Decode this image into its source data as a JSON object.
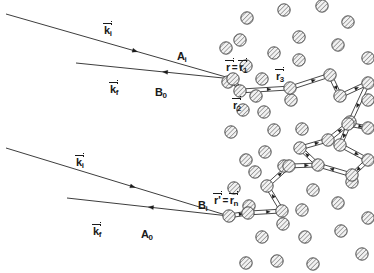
{
  "figure": {
    "background_color": "#ffffff",
    "line_color": "#1a1a1a",
    "scatterer_fill": "#e8e8e8",
    "scatterer_stroke": "#3a3a3a",
    "scatterer_radius": 6.2
  },
  "labels": [
    {
      "name": "k-incident-upper",
      "base": "k",
      "sub": "i",
      "vector": true,
      "x": 104,
      "y": 21
    },
    {
      "name": "k-final-upper",
      "base": "k",
      "sub": "f",
      "vector": true,
      "x": 110,
      "y": 80
    },
    {
      "name": "path-label-A-i",
      "base": "A",
      "sub": "i",
      "vector": false,
      "x": 177,
      "y": 47
    },
    {
      "name": "path-label-B-0",
      "base": "B",
      "sub": "0",
      "vector": false,
      "x": 155,
      "y": 83
    },
    {
      "name": "k-incident-lower",
      "base": "k",
      "sub": "i",
      "vector": true,
      "x": 76,
      "y": 153
    },
    {
      "name": "k-final-lower",
      "base": "k",
      "sub": "f",
      "vector": true,
      "x": 93,
      "y": 222
    },
    {
      "name": "path-label-B-i",
      "base": "B",
      "sub": "i",
      "vector": false,
      "x": 198,
      "y": 196
    },
    {
      "name": "path-label-A-0",
      "base": "A",
      "sub": "0",
      "vector": false,
      "x": 141,
      "y": 225
    },
    {
      "name": "position-r-2",
      "base": "r",
      "sub": "2",
      "vector": true,
      "x": 233,
      "y": 96
    },
    {
      "name": "position-r-3",
      "base": "r",
      "sub": "3",
      "vector": true,
      "x": 276,
      "y": 67
    }
  ],
  "compound_labels": [
    {
      "name": "position-r-equals-r1",
      "x": 226,
      "y": 58,
      "left": {
        "base": "r",
        "sub": "",
        "vector": true
      },
      "eq": "=",
      "right": {
        "base": "r",
        "sub": "1",
        "vector": true
      }
    },
    {
      "name": "position-rprime-equals-rn",
      "x": 214,
      "y": 191,
      "left": {
        "base": "r'",
        "sub": "",
        "vector": true
      },
      "eq": "=",
      "right": {
        "base": "r",
        "sub": "n",
        "vector": true
      }
    }
  ],
  "chart_data": {
    "type": "diagram",
    "beams": [
      {
        "name": "upper-incident-beam",
        "label": "k_i",
        "x1": 6,
        "y1": 14,
        "x2": 233,
        "y2": 79,
        "arrow_at": 0.56,
        "arrow_dir": "forward"
      },
      {
        "name": "upper-outgoing-beam",
        "label": "k_f",
        "x1": 76,
        "y1": 63,
        "x2": 233,
        "y2": 79,
        "arrow_at": 0.58,
        "arrow_dir": "backward"
      },
      {
        "name": "lower-incident-beam",
        "label": "k_i",
        "x1": 6,
        "y1": 148,
        "x2": 229,
        "y2": 216,
        "arrow_at": 0.56,
        "arrow_dir": "forward"
      },
      {
        "name": "lower-outgoing-beam",
        "label": "k_f",
        "x1": 67,
        "y1": 198,
        "x2": 229,
        "y2": 216,
        "arrow_at": 0.53,
        "arrow_dir": "backward"
      }
    ],
    "path_upper": [
      [
        233,
        79
      ],
      [
        240,
        91
      ],
      [
        290,
        88
      ],
      [
        330,
        75
      ],
      [
        340,
        96
      ],
      [
        368,
        83
      ],
      [
        350,
        122
      ],
      [
        340,
        145
      ],
      [
        368,
        160
      ],
      [
        352,
        175
      ],
      [
        318,
        165
      ]
    ],
    "path_lower": [
      [
        229,
        216
      ],
      [
        248,
        213
      ],
      [
        282,
        211
      ],
      [
        267,
        186
      ],
      [
        289,
        166
      ],
      [
        318,
        165
      ],
      [
        300,
        148
      ],
      [
        328,
        140
      ],
      [
        348,
        124
      ],
      [
        368,
        128
      ]
    ],
    "scatterers": [
      [
        247,
        18
      ],
      [
        284,
        10
      ],
      [
        274,
        53
      ],
      [
        240,
        40
      ],
      [
        299,
        37
      ],
      [
        322,
        6
      ],
      [
        338,
        45
      ],
      [
        348,
        22
      ],
      [
        368,
        58
      ],
      [
        246,
        66
      ],
      [
        262,
        79
      ],
      [
        299,
        60
      ],
      [
        256,
        96
      ],
      [
        264,
        112
      ],
      [
        291,
        100
      ],
      [
        243,
        110
      ],
      [
        231,
        132
      ],
      [
        274,
        130
      ],
      [
        302,
        129
      ],
      [
        265,
        152
      ],
      [
        246,
        160
      ],
      [
        284,
        166
      ],
      [
        255,
        172
      ],
      [
        234,
        188
      ],
      [
        313,
        190
      ],
      [
        249,
        206
      ],
      [
        283,
        224
      ],
      [
        262,
        237
      ],
      [
        305,
        237
      ],
      [
        338,
        203
      ],
      [
        341,
        231
      ],
      [
        368,
        218
      ],
      [
        246,
        263
      ],
      [
        277,
        261
      ],
      [
        313,
        264
      ],
      [
        362,
        254
      ],
      [
        352,
        182
      ],
      [
        368,
        100
      ],
      [
        226,
        48
      ],
      [
        228,
        82
      ],
      [
        302,
        210
      ]
    ],
    "path_node_scatterers_upper": [
      [
        233,
        79
      ],
      [
        240,
        91
      ],
      [
        290,
        88
      ],
      [
        330,
        75
      ],
      [
        340,
        96
      ],
      [
        368,
        83
      ],
      [
        350,
        122
      ],
      [
        340,
        145
      ],
      [
        368,
        160
      ],
      [
        352,
        175
      ]
    ],
    "path_node_scatterers_lower": [
      [
        229,
        216
      ],
      [
        248,
        213
      ],
      [
        282,
        211
      ],
      [
        267,
        186
      ],
      [
        289,
        166
      ],
      [
        318,
        165
      ],
      [
        300,
        148
      ],
      [
        328,
        140
      ],
      [
        348,
        124
      ],
      [
        368,
        128
      ]
    ]
  }
}
